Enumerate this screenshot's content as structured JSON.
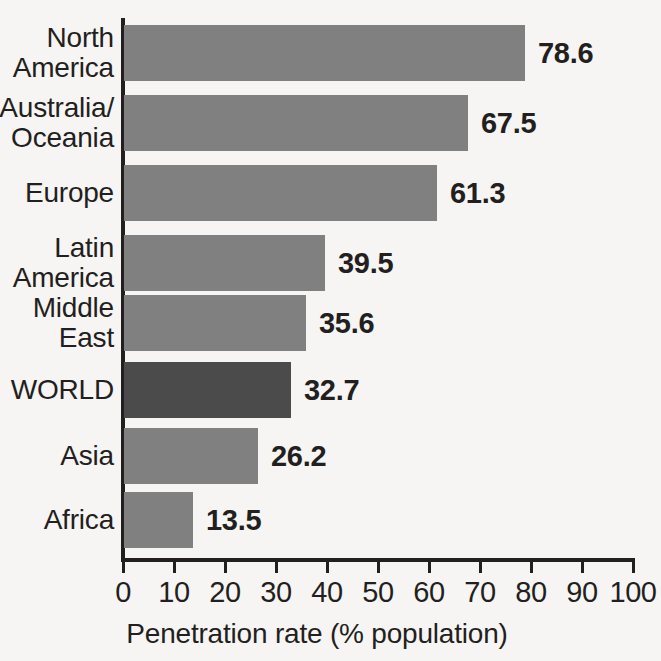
{
  "chart_data": {
    "type": "bar",
    "orientation": "horizontal",
    "title": "",
    "xlabel": "Penetration rate (% population)",
    "ylabel": "",
    "xlim": [
      0,
      100
    ],
    "xticks": [
      0,
      10,
      20,
      30,
      40,
      50,
      60,
      70,
      80,
      90,
      100
    ],
    "xtick_labels": [
      "0",
      "10",
      "20",
      "30",
      "40",
      "50",
      "60",
      "70",
      "80",
      "90",
      "100"
    ],
    "grid": false,
    "legend": false,
    "categories": [
      "North America",
      "Australia/ Oceania",
      "Europe",
      "Latin America",
      "Middle East",
      "WORLD",
      "Asia",
      "Africa"
    ],
    "values": [
      78.6,
      67.5,
      61.3,
      39.5,
      35.6,
      32.7,
      26.2,
      13.5
    ],
    "value_labels": [
      "78.6",
      "67.5",
      "61.3",
      "39.5",
      "35.6",
      "32.7",
      "26.2",
      "13.5"
    ],
    "highlighted_category": "WORLD",
    "bar_color": "#808080",
    "highlight_bar_color": "#4b4b4b",
    "background_color": "#f6f5f3",
    "text_color": "#231f20"
  },
  "axis": {
    "x_title": "Penetration rate (% population)",
    "tick_labels": [
      "0",
      "10",
      "20",
      "30",
      "40",
      "50",
      "60",
      "70",
      "80",
      "90",
      "100"
    ]
  },
  "rows": [
    {
      "label": "North\nAmerica",
      "value_label": "78.6",
      "value": 78.6,
      "highlight": false
    },
    {
      "label": "Australia/\nOceania",
      "value_label": "67.5",
      "value": 67.5,
      "highlight": false
    },
    {
      "label": "Europe",
      "value_label": "61.3",
      "value": 61.3,
      "highlight": false
    },
    {
      "label": "Latin\nAmerica",
      "value_label": "39.5",
      "value": 39.5,
      "highlight": false
    },
    {
      "label": "Middle\nEast",
      "value_label": "35.6",
      "value": 35.6,
      "highlight": false
    },
    {
      "label": "WORLD",
      "value_label": "32.7",
      "value": 32.7,
      "highlight": true
    },
    {
      "label": "Asia",
      "value_label": "26.2",
      "value": 26.2,
      "highlight": false
    },
    {
      "label": "Africa",
      "value_label": "13.5",
      "value": 13.5,
      "highlight": false
    }
  ]
}
